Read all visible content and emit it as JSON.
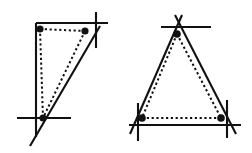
{
  "figure": {
    "background_color": "#ffffff",
    "ink_color": "#111111",
    "width": 252,
    "height": 153,
    "panels": [
      {
        "id": "left-panel",
        "name": "right-triangle-figure",
        "description": "Right triangle with vertical left leg, horizontal top leg and slanted hypotenuse, plus inner dotted triangle joining three marked points",
        "solid_triangle": {
          "name": "outer-solid-triangle",
          "vertices": [
            {
              "name": "top-left-corner",
              "x": 36,
              "y": 23
            },
            {
              "name": "top-right-corner",
              "x": 108,
              "y": 23
            },
            {
              "name": "bottom-corner",
              "x": 36,
              "y": 137
            }
          ],
          "edges": [
            {
              "name": "top-edge",
              "x1": 36,
              "y1": 23,
              "x2": 108,
              "y2": 23
            },
            {
              "name": "left-edge",
              "x1": 36,
              "y1": 23,
              "x2": 36,
              "y2": 137
            },
            {
              "name": "hypotenuse-edge",
              "x1": 100,
              "y1": 26,
              "x2": 30,
              "y2": 146
            }
          ]
        },
        "dotted_triangle": {
          "name": "inner-dotted-triangle",
          "edges": [
            {
              "name": "dotted-top-edge",
              "x1": 40,
              "y1": 29,
              "x2": 85,
              "y2": 31
            },
            {
              "name": "dotted-left-edge",
              "x1": 40,
              "y1": 29,
              "x2": 43,
              "y2": 118
            },
            {
              "name": "dotted-slant-edge",
              "x1": 85,
              "y1": 31,
              "x2": 43,
              "y2": 118
            }
          ]
        },
        "dots": [
          {
            "name": "vertex-dot-top-left",
            "x": 40,
            "y": 29,
            "r": 3.6
          },
          {
            "name": "vertex-dot-top-right",
            "x": 85,
            "y": 31,
            "r": 3.6
          },
          {
            "name": "vertex-dot-bottom",
            "x": 43,
            "y": 118,
            "r": 3.6
          }
        ],
        "ticks": [
          {
            "name": "tick-vertical-top-right",
            "x1": 96,
            "y1": 12,
            "x2": 96,
            "y2": 48
          },
          {
            "name": "tick-horizontal-bottom",
            "x1": 17,
            "y1": 118,
            "x2": 71,
            "y2": 118
          }
        ]
      },
      {
        "id": "right-panel",
        "name": "isosceles-triangle-figure",
        "description": "Isosceles triangle with apex on top and horizontal base, plus inner dotted triangle joining three marked points",
        "solid_triangle": {
          "name": "outer-solid-triangle",
          "vertices": [
            {
              "name": "apex-corner",
              "x": 179,
              "y": 17
            },
            {
              "name": "bottom-left-corner",
              "x": 131,
              "y": 125
            },
            {
              "name": "bottom-right-corner",
              "x": 240,
              "y": 125
            }
          ],
          "edges": [
            {
              "name": "left-edge",
              "x1": 182,
              "y1": 15,
              "x2": 130,
              "y2": 134
            },
            {
              "name": "right-edge",
              "x1": 175,
              "y1": 15,
              "x2": 236,
              "y2": 134
            },
            {
              "name": "base-edge",
              "x1": 129,
              "y1": 125,
              "x2": 241,
              "y2": 125
            }
          ]
        },
        "dotted_triangle": {
          "name": "inner-dotted-triangle",
          "edges": [
            {
              "name": "dotted-left-edge",
              "x1": 177,
              "y1": 34,
              "x2": 142,
              "y2": 118
            },
            {
              "name": "dotted-right-edge",
              "x1": 177,
              "y1": 34,
              "x2": 221,
              "y2": 118
            },
            {
              "name": "dotted-base-edge",
              "x1": 142,
              "y1": 118,
              "x2": 221,
              "y2": 118
            }
          ]
        },
        "dots": [
          {
            "name": "vertex-dot-apex",
            "x": 177,
            "y": 34,
            "r": 3.8
          },
          {
            "name": "vertex-dot-bottom-left",
            "x": 142,
            "y": 118,
            "r": 3.8
          },
          {
            "name": "vertex-dot-bottom-right",
            "x": 221,
            "y": 118,
            "r": 3.8
          }
        ],
        "ticks": [
          {
            "name": "tick-horizontal-apex",
            "x1": 161,
            "y1": 27,
            "x2": 211,
            "y2": 27
          },
          {
            "name": "tick-vertical-bottom-left",
            "x1": 138,
            "y1": 103,
            "x2": 138,
            "y2": 141
          },
          {
            "name": "tick-vertical-bottom-right",
            "x1": 227,
            "y1": 100,
            "x2": 227,
            "y2": 138
          }
        ]
      }
    ]
  }
}
